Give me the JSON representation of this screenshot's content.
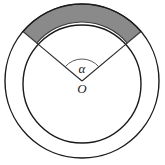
{
  "figure": {
    "name": "annulus-with-central-angle",
    "background_color": "#ffffff",
    "stroke_color": "#1a1a1a",
    "shaded_fill_color": "#8a8a8a",
    "shaded_stroke_color": "#3c3c3c",
    "labels": {
      "angle_label": "α",
      "center_label": "O"
    },
    "geometry": {
      "center_x": 82,
      "center_y": 81,
      "outer_radius": 77,
      "inner_radius": 59,
      "sector_start_angle_deg": -140,
      "sector_end_angle_deg": -40,
      "sector_sweep_deg": 100,
      "angle_arc_radius": 22
    },
    "elements": {
      "outer_circle": "outer-circle",
      "inner_circle": "inner-circle",
      "shaded_sector": "shaded-annular-sector",
      "left_radius": "left-radius-line",
      "right_radius": "right-radius-line",
      "angle_arc": "angle-arc-marker",
      "center_point": "center-point-o"
    }
  }
}
